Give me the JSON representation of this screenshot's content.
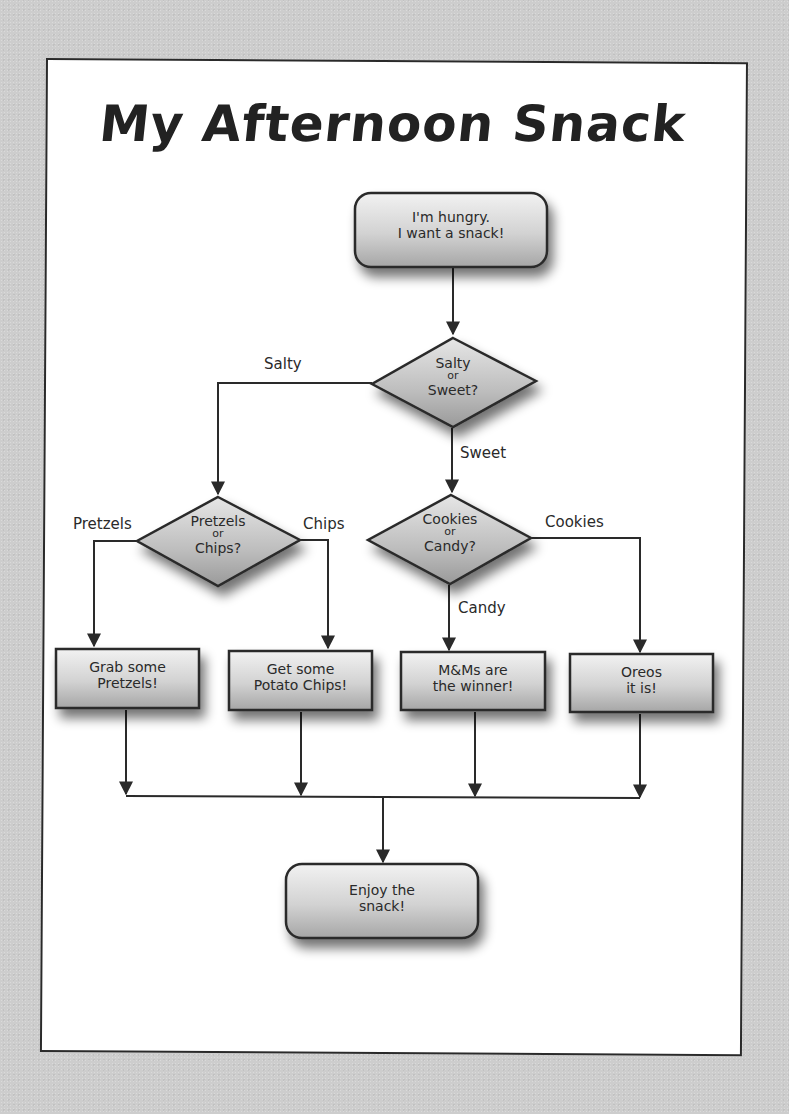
{
  "title": "My Afternoon Snack",
  "colors": {
    "background": "#cdcdcd",
    "panel": "#ffffff",
    "stroke": "#2a2a2a",
    "node_fill_light": "#eeeeee",
    "node_fill_dark": "#a9a9a9"
  },
  "nodes": {
    "start": {
      "type": "rounded-rect",
      "line1": "I'm hungry.",
      "line2": "I want a snack!"
    },
    "salty_sweet": {
      "type": "diamond",
      "line1": "Salty",
      "or": "or",
      "line2": "Sweet?"
    },
    "pretzels_chips": {
      "type": "diamond",
      "line1": "Pretzels",
      "or": "or",
      "line2": "Chips?"
    },
    "cookies_candy": {
      "type": "diamond",
      "line1": "Cookies",
      "or": "or",
      "line2": "Candy?"
    },
    "pretzels": {
      "type": "rect",
      "line1": "Grab some",
      "line2": "Pretzels!"
    },
    "chips": {
      "type": "rect",
      "line1": "Get some",
      "line2": "Potato Chips!"
    },
    "mms": {
      "type": "rect",
      "line1": "M&Ms are",
      "line2": "the winner!"
    },
    "oreos": {
      "type": "rect",
      "line1": "Oreos",
      "line2": "it is!"
    },
    "end": {
      "type": "rounded-rect",
      "line1": "Enjoy the",
      "line2": "snack!"
    }
  },
  "edges": {
    "salty": "Salty",
    "sweet": "Sweet",
    "pretzels": "Pretzels",
    "chips": "Chips",
    "cookies": "Cookies",
    "candy": "Candy"
  },
  "connections": [
    {
      "from": "start",
      "to": "salty_sweet",
      "label": ""
    },
    {
      "from": "salty_sweet",
      "to": "pretzels_chips",
      "label": "Salty"
    },
    {
      "from": "salty_sweet",
      "to": "cookies_candy",
      "label": "Sweet"
    },
    {
      "from": "pretzels_chips",
      "to": "pretzels",
      "label": "Pretzels"
    },
    {
      "from": "pretzels_chips",
      "to": "chips",
      "label": "Chips"
    },
    {
      "from": "cookies_candy",
      "to": "mms",
      "label": "Candy"
    },
    {
      "from": "cookies_candy",
      "to": "oreos",
      "label": "Cookies"
    },
    {
      "from": "pretzels",
      "to": "end",
      "label": ""
    },
    {
      "from": "chips",
      "to": "end",
      "label": ""
    },
    {
      "from": "mms",
      "to": "end",
      "label": ""
    },
    {
      "from": "oreos",
      "to": "end",
      "label": ""
    }
  ]
}
